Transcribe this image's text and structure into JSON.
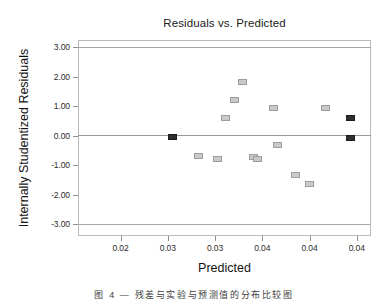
{
  "chart_data": {
    "type": "scatter",
    "title": "Residuals vs. Predicted",
    "xlabel": "Predicted",
    "ylabel": "Internally Studentized Residuals",
    "grid": false,
    "legend": null,
    "xlim": [
      0.0155,
      0.0465
    ],
    "ylim": [
      -3.3,
      3.3
    ],
    "xticks": [
      0.02,
      0.025,
      0.03,
      0.035,
      0.04,
      0.045
    ],
    "xtick_labels": [
      "0.02",
      "0.03",
      "0.03",
      "0.04",
      "0.04",
      "0.04"
    ],
    "yticks": [
      3,
      2,
      1,
      0,
      -1,
      -2,
      -3
    ],
    "ytick_labels": [
      "3.00",
      "2.00",
      "1.00",
      "0.00",
      "-1.00",
      "-2.00",
      "-3.00"
    ],
    "reference_lines": [
      {
        "y": 3.0,
        "style": "solid"
      },
      {
        "y": 0.0,
        "style": "solid"
      },
      {
        "y": -3.0,
        "style": "solid"
      }
    ],
    "series": [
      {
        "name": "residuals",
        "marker": "square",
        "points": [
          {
            "x": 0.0255,
            "y": -0.05,
            "color": "dark"
          },
          {
            "x": 0.0282,
            "y": -0.7,
            "color": "light"
          },
          {
            "x": 0.0303,
            "y": -0.78,
            "color": "light"
          },
          {
            "x": 0.0311,
            "y": 0.58,
            "color": "light"
          },
          {
            "x": 0.0321,
            "y": 1.22,
            "color": "light"
          },
          {
            "x": 0.0329,
            "y": 1.8,
            "color": "light"
          },
          {
            "x": 0.0341,
            "y": -0.73,
            "color": "light"
          },
          {
            "x": 0.0345,
            "y": -0.78,
            "color": "light"
          },
          {
            "x": 0.0362,
            "y": 0.92,
            "color": "light"
          },
          {
            "x": 0.0366,
            "y": -0.33,
            "color": "light"
          },
          {
            "x": 0.0385,
            "y": -1.33,
            "color": "light"
          },
          {
            "x": 0.04,
            "y": -1.65,
            "color": "light"
          },
          {
            "x": 0.0417,
            "y": 0.92,
            "color": "light"
          },
          {
            "x": 0.0443,
            "y": 0.58,
            "color": "dark"
          },
          {
            "x": 0.0443,
            "y": -0.08,
            "color": "dark"
          }
        ]
      }
    ]
  },
  "caption": {
    "text": "图 4 — 残差与实验与预测值的分布比较图"
  }
}
